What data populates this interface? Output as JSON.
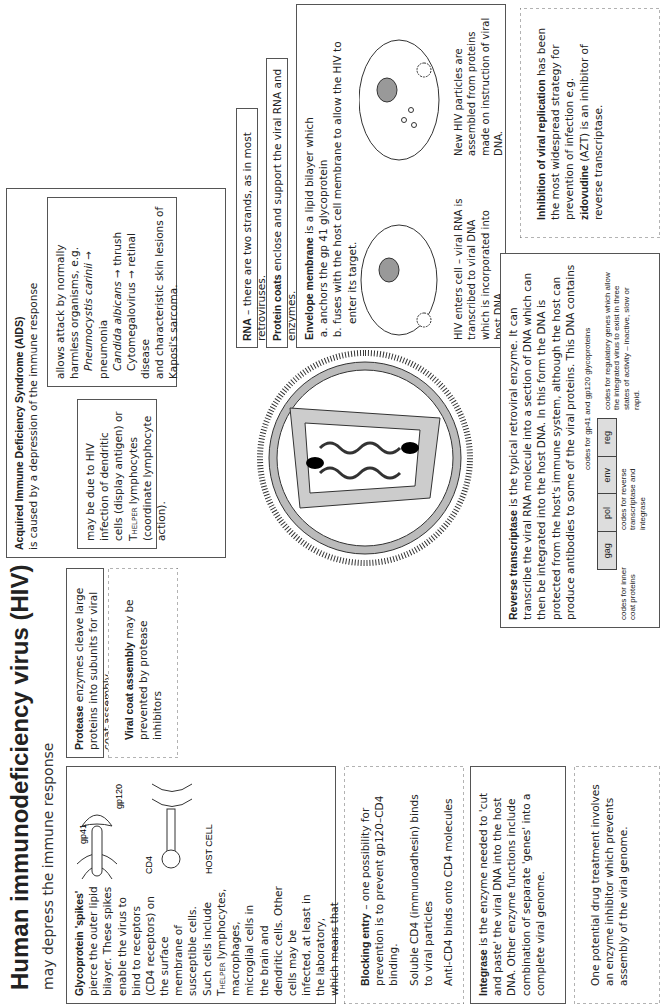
{
  "header": {
    "title": "Human immunodeficiency virus (HIV)",
    "subtitle": "may depress the immune response"
  },
  "glycoprotein": {
    "heading": "Glycoprotein 'spikes'",
    "text1": " pierce the outer lipid bilayer. These spikes enable the virus to bind to receptors (CD4 receptors) on the surface membrane of susceptible cells. Such cells include T",
    "sub": "HELPER",
    "text2": " lymphocytes, macrophages, microglial cells in the brain and dendritic cells. Other cells may be infected, at least in the laboratory, which means that CD4 may not be the only receptor.",
    "labels": {
      "gp41": "gp41",
      "gp120": "gp120",
      "cd4": "CD4",
      "host": "HOST CELL"
    }
  },
  "blocking": {
    "heading": "Blocking entry",
    "text": " – one possibility for prevention is to prevent gp120–CD4 binding.",
    "p2": "Soluble CD4 (immunoadhesin) binds to viral particles",
    "p3": "Anti-CD4 binds onto CD4 molecules"
  },
  "integrase": {
    "heading": "Integrase",
    "text": " is the enzyme needed to 'cut and paste' the viral DNA into the host DNA. Other enzyme functions include combination of separate 'genes' into a complete viral genome."
  },
  "drug": {
    "text": "One potential drug treatment involves an enzyme inhibitor which prevents assembly of the viral genome."
  },
  "protease": {
    "heading": "Protease",
    "text": " enzymes cleave large proteins into subunits for viral coat assembly"
  },
  "viral_coat": {
    "heading": "Viral coat assembly",
    "text": " may be prevented by protease inhibitors"
  },
  "aids": {
    "heading": "Acquired Immune Deficiency Syndrome (AIDS)",
    "sub": "is caused by a depression of the immune response",
    "left": "may be due to HIV infection of dendritic cells (display antigen) or T",
    "left_sub": "HELPER",
    "left2": " lymphocytes (coordinate lymphocyte action).",
    "right_intro": "allows attack by normally harmless organisms, e.g.",
    "right_items": [
      {
        "org": "Pneumocystis carinii",
        "result": " → pneumonia"
      },
      {
        "org": "Candida albicans",
        "result": " → thrush"
      },
      {
        "org": "",
        "result": "Cytomegalovirus → retinal disease"
      }
    ],
    "right_end": "and characteristic skin lesions of Kaposi's sarcoma."
  },
  "rna": {
    "heading": "RNA",
    "text": " – there are two strands, as in most retroviruses."
  },
  "protein_coats": {
    "heading": "Protein coats",
    "text": " enclose and support the viral RNA and enzymes."
  },
  "envelope": {
    "heading": "Envelope membrane",
    "text": " is a lipid bilayer which",
    "items": [
      "anchors the gp 41 glycoprotein",
      "fuses with the host cell membrane to allow the HIV to enter its target."
    ],
    "cell1_caption": "HIV enters cell – viral RNA is transcribed to viral DNA which is incorporated into host DNA.",
    "cell2_caption": "New HIV particles are assembled from proteins made on instruction of viral DNA."
  },
  "reverse": {
    "heading": "Reverse transcriptase",
    "text": " is the typical retroviral enzyme. It can transcribe the viral RNA molecule into a section of DNA which can then be integrated into the host DNA. In this form the DNA is protected from the host's immune system, although the host can produce antibodies to some of the viral proteins. This DNA contains",
    "genes": [
      "gag",
      "pol",
      "env",
      "reg"
    ],
    "gag_note": "codes for inner coat proteins",
    "pol_note": "codes for reverse transcriptase and integrase",
    "env_note": "codes for gp41 and gp120 glycoproteins",
    "reg_note": "codes for regulatory genes which allow the integrated virus to exist in three states of activity – inactive, slow or rapid."
  },
  "inhibition": {
    "heading": "Inhibition of viral replication",
    "text1": " has been the most widespread strategy for prevention of infection e.g. ",
    "drug": "zidovudine",
    "text2": " (AZT) is an inhibitor of reverse transcriptase."
  }
}
